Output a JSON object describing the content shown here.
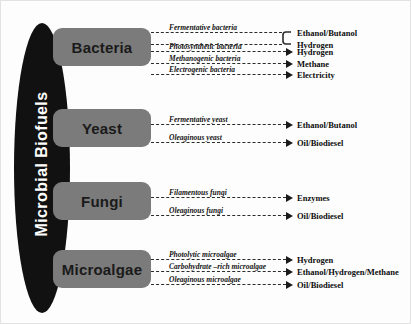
{
  "title": "Microbial Biofuels",
  "trunk": {
    "label": "Microbial Biofuels",
    "color": "#111111",
    "text_color": "#ffffff"
  },
  "box_color": "#7b7b7b",
  "line_color": "#2b2b2b",
  "groups": [
    {
      "name": "Bacteria",
      "box": {
        "x": 52,
        "y": 27,
        "w": 98,
        "h": 38
      },
      "branches": [
        {
          "label": "Fermentative bacteria",
          "product": "Ethanol/Butanol",
          "y": 26,
          "braced": true
        },
        {
          "label": "",
          "product": "Hydrogen",
          "y": 38,
          "braced": true
        },
        {
          "label": "Photosynthetic bacteria",
          "product": "Hydrogen",
          "y": 45,
          "braced": false
        },
        {
          "label": "Methanogenic bacteria",
          "product": "Methane",
          "y": 57,
          "braced": false
        },
        {
          "label": "Electrogenic bacteria",
          "product": "Electricity",
          "y": 68,
          "braced": false
        }
      ]
    },
    {
      "name": "Yeast",
      "box": {
        "x": 52,
        "y": 108,
        "w": 98,
        "h": 38
      },
      "branches": [
        {
          "label": "Fermentative yeast",
          "product": "Ethanol/Butanol",
          "y": 118,
          "braced": false
        },
        {
          "label": "Oleaginous yeast",
          "product": "Oil/Biodiesel",
          "y": 136,
          "braced": false
        }
      ]
    },
    {
      "name": "Fungi",
      "box": {
        "x": 52,
        "y": 181,
        "w": 98,
        "h": 38
      },
      "branches": [
        {
          "label": "Filamentous fungi",
          "product": "Enzymes",
          "y": 191,
          "braced": false
        },
        {
          "label": "Oleaginous fungi",
          "product": "Oil/Biodiesel",
          "y": 209,
          "braced": false
        }
      ]
    },
    {
      "name": "Microalgae",
      "box": {
        "x": 52,
        "y": 249,
        "w": 98,
        "h": 38
      },
      "branches": [
        {
          "label": "Photolytic microalgae",
          "product": "Hydrogen",
          "y": 253,
          "braced": false
        },
        {
          "label": "Carbohydrate –rich  microalgae",
          "product": "Ethanol/Hydrogen/Methane",
          "y": 265,
          "braced": false
        },
        {
          "label": "Oleaginous microalgae",
          "product": "Oil/Biodiesel",
          "y": 278,
          "braced": false
        }
      ]
    }
  ],
  "geometry": {
    "line_start_x": 150,
    "arrow_x": 285,
    "product_x": 296,
    "brace_x": 281
  }
}
